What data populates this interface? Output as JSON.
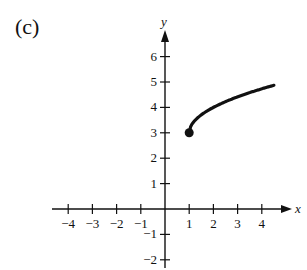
{
  "figure_label": "(c)",
  "chart_data": {
    "type": "line",
    "title": "",
    "xlabel": "x",
    "ylabel": "y",
    "function": "y = sqrt(x - 1) + 3",
    "start_point": {
      "x": 1,
      "y": 3,
      "marker": "filled-circle"
    },
    "x": [
      1,
      1.25,
      1.5,
      2,
      2.5,
      3,
      3.5,
      4,
      4.5
    ],
    "values": [
      3,
      3.5,
      3.71,
      4,
      4.22,
      4.41,
      4.58,
      4.73,
      4.87
    ],
    "xlim": [
      -4.5,
      5
    ],
    "ylim": [
      -2.3,
      6.8
    ],
    "x_ticks": [
      -4,
      -3,
      -2,
      -1,
      1,
      2,
      3,
      4
    ],
    "x_tick_labels": [
      "−4",
      "−3",
      "−2",
      "−1",
      "1",
      "2",
      "3",
      "4"
    ],
    "y_ticks": [
      -2,
      -1,
      1,
      2,
      3,
      4,
      5,
      6
    ],
    "y_tick_labels": [
      "−2",
      "−1",
      "1",
      "2",
      "3",
      "4",
      "5",
      "6"
    ],
    "grid": false,
    "legend": null
  }
}
